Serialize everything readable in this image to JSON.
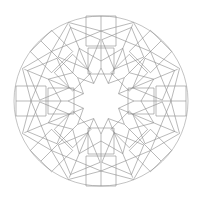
{
  "page": {
    "background_color": "#ffffff",
    "width": 202,
    "height": 200
  },
  "caption": {
    "text": "",
    "color": "#b9b9b9",
    "visible": false,
    "note_clipped_top_edge": true
  },
  "figure": {
    "name": "geometric-mandala",
    "title": "",
    "kind": "islamic-geometric-rosette",
    "symmetry_fold": 8,
    "line_color": "#8a8a8a",
    "circle_color": "#9a9a9a",
    "line_width": 0.6,
    "fill": "none",
    "center": {
      "x": 101,
      "y": 101
    },
    "outer_circle_radius_x": 87,
    "outer_circle_radius_y": 85,
    "center_void": {
      "shape": "8-pointed-star",
      "outer_radius": 33,
      "inner_radius": 19,
      "filled": false
    },
    "rings": [
      {
        "name": "inner-ring-squares",
        "count": 8,
        "center_radius": 40,
        "half_size": 13,
        "rotation_offset_deg": 0
      },
      {
        "name": "middle-ring-squares",
        "count": 8,
        "center_radius": 57,
        "half_size": 16,
        "rotation_offset_deg": 22.5
      },
      {
        "name": "outer-ring-squares",
        "count": 8,
        "center_radius": 70,
        "half_size": 15,
        "rotation_offset_deg": 0
      }
    ]
  }
}
